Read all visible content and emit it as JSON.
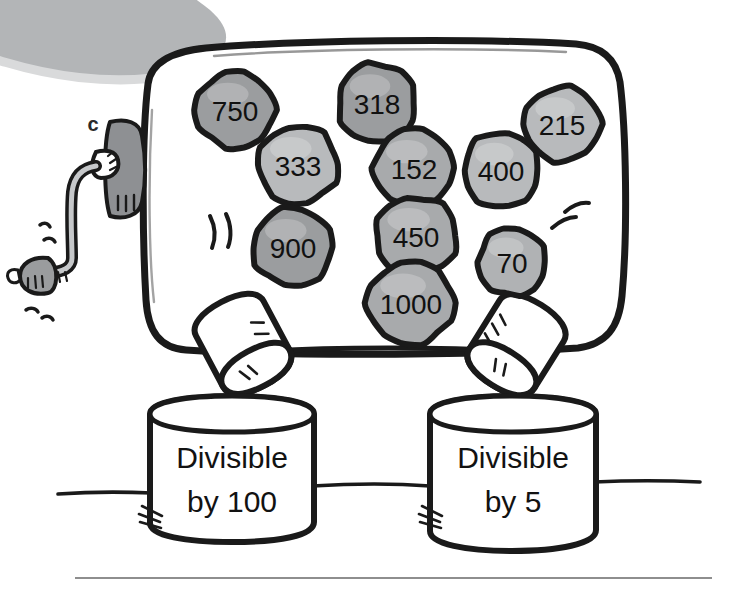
{
  "illustration": {
    "title": "Number sorting machine",
    "part_letter": "c",
    "background_color": "#ffffff",
    "ink_color": "#1a1a1a",
    "corner_blob_color": "#b3b5b7",
    "crank_color": "#8e9093",
    "ground_line": true,
    "footer_rule": true
  },
  "balls": [
    {
      "value": "750",
      "cx": 235,
      "cy": 110,
      "rx": 40,
      "ry": 38,
      "fill": "#9b9d9f",
      "font_size": 28
    },
    {
      "value": "318",
      "cx": 377,
      "cy": 103,
      "rx": 39,
      "ry": 40,
      "fill": "#9b9d9f",
      "font_size": 28
    },
    {
      "value": "333",
      "cx": 298,
      "cy": 165,
      "rx": 40,
      "ry": 39,
      "fill": "#b8babc",
      "font_size": 28
    },
    {
      "value": "152",
      "cx": 414,
      "cy": 168,
      "rx": 40,
      "ry": 39,
      "fill": "#a8aaac",
      "font_size": 28
    },
    {
      "value": "400",
      "cx": 501,
      "cy": 170,
      "rx": 37,
      "ry": 38,
      "fill": "#b8babc",
      "font_size": 28
    },
    {
      "value": "215",
      "cx": 562,
      "cy": 124,
      "rx": 38,
      "ry": 37,
      "fill": "#b8babc",
      "font_size": 28
    },
    {
      "value": "900",
      "cx": 293,
      "cy": 247,
      "rx": 40,
      "ry": 39,
      "fill": "#9b9d9f",
      "font_size": 28
    },
    {
      "value": "450",
      "cx": 416,
      "cy": 236,
      "rx": 41,
      "ry": 39,
      "fill": "#a8aaac",
      "font_size": 28
    },
    {
      "value": "1000",
      "cx": 411,
      "cy": 303,
      "rx": 44,
      "ry": 41,
      "fill": "#a8aaac",
      "font_size": 28
    },
    {
      "value": "70",
      "cx": 512,
      "cy": 262,
      "rx": 34,
      "ry": 34,
      "fill": "#b0b2b4",
      "font_size": 28
    }
  ],
  "bins": [
    {
      "id": "bin-divisible-by-100",
      "line1": "Divisible",
      "line2": "by 100",
      "x": 148,
      "y": 398,
      "width": 166,
      "height": 142
    },
    {
      "id": "bin-divisible-by-5",
      "line1": "Divisible",
      "line2": "by 5",
      "x": 428,
      "y": 398,
      "width": 168,
      "height": 150
    }
  ],
  "chutes": [
    {
      "id": "chute-left",
      "tilt": -28,
      "cx": 241,
      "cy": 346
    },
    {
      "id": "chute-right",
      "tilt": 32,
      "cx": 513,
      "cy": 345
    }
  ],
  "motion_marks": [
    {
      "id": "motion-left-of-900",
      "x": 214,
      "y": 228
    },
    {
      "id": "motion-right-of-70",
      "x": 561,
      "y": 221
    }
  ]
}
